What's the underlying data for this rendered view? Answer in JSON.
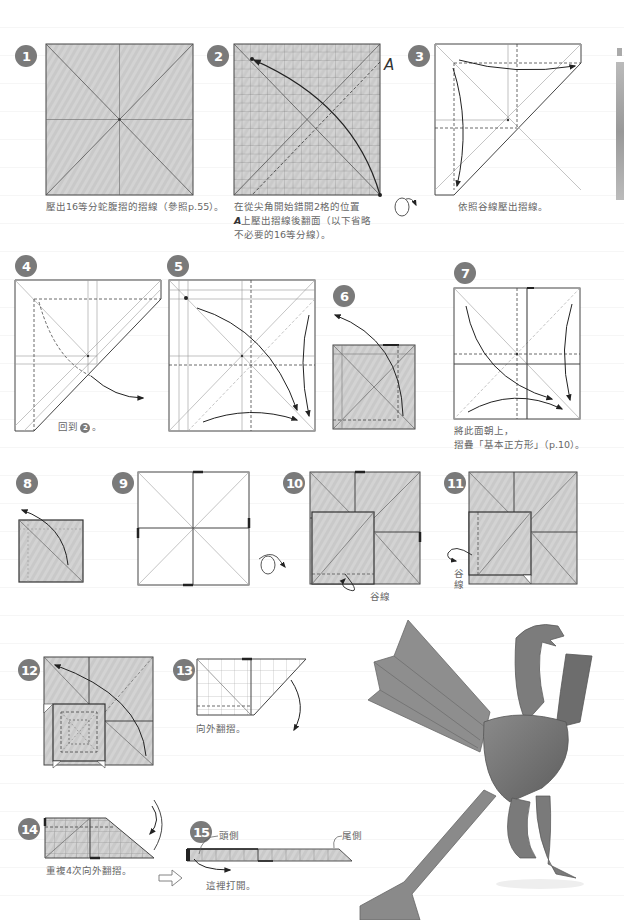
{
  "page": {
    "type": "origami-instructions",
    "paper_color": "#c8c8c8",
    "line_color": "#444444",
    "badge_color": "#7a7a7a"
  },
  "steps": [
    {
      "num": "1",
      "caption": "壓出16等分蛇腹摺的摺線（參照p.55）。"
    },
    {
      "num": "2",
      "caption_line1": "在從尖角開始錯開2格的位置",
      "caption_line2_label": "A",
      "caption_line2": "上壓出摺線後翻面（以下省略",
      "caption_line3": "不必要的16等分線）。",
      "point_label": "A"
    },
    {
      "num": "3",
      "caption": "依照谷線壓出摺線。"
    },
    {
      "num": "4",
      "caption": "回到",
      "caption_ref": "2",
      "caption_end": "。"
    },
    {
      "num": "5"
    },
    {
      "num": "6"
    },
    {
      "num": "7",
      "caption_line1": "將此面朝上，",
      "caption_line2": "摺疊「基本正方形」（p.10）。"
    },
    {
      "num": "8"
    },
    {
      "num": "9"
    },
    {
      "num": "10",
      "label": "谷線"
    },
    {
      "num": "11",
      "label": "谷線"
    },
    {
      "num": "12"
    },
    {
      "num": "13",
      "caption": "向外翻摺。"
    },
    {
      "num": "14",
      "caption": "重複4次向外翻摺。"
    },
    {
      "num": "15",
      "label_head": "頭側",
      "label_tail": "尾側",
      "caption": "這裡打開。"
    }
  ],
  "photo": {
    "subject": "origami-phoenix-photo"
  }
}
